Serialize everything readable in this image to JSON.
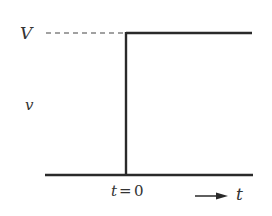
{
  "diagram": {
    "type": "step-function",
    "labels": {
      "level": "V",
      "variable": "v",
      "time_eq": "t",
      "equals": "=",
      "zero": "0",
      "time_axis": "t"
    },
    "colors": {
      "line": "#2a2a2a",
      "text": "#333333",
      "background": "#ffffff"
    }
  }
}
